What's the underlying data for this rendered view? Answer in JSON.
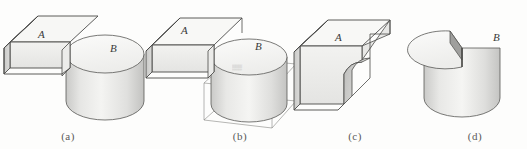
{
  "figure": {
    "background_color": "#fdfdfc",
    "line_color": "#4a4a4a",
    "label_color": "#3a3a3a",
    "caption_color": "#5a5a5a",
    "fill_light": "#f4f4f2",
    "fill_mid": "#e2e2e0",
    "fill_dark": "#c8c8c6",
    "solids": {
      "box_label": "A",
      "cylinder_label": "B"
    },
    "panels": [
      {
        "id": "a",
        "caption": "(a)",
        "caption_x": 68,
        "operation": "two separate solids A and B shown intersecting in place",
        "labels": [
          {
            "text": "A",
            "x": 38,
            "y": 38
          },
          {
            "text": "B",
            "x": 110,
            "y": 52
          }
        ]
      },
      {
        "id": "b",
        "caption": "(b)",
        "caption_x": 240,
        "operation": "union of A and B with wireframe bounding box",
        "labels": [
          {
            "text": "A",
            "x": 181,
            "y": 34
          },
          {
            "text": "B",
            "x": 255,
            "y": 50
          }
        ],
        "artifact_mark": "scan-smudge"
      },
      {
        "id": "c",
        "caption": "(c)",
        "caption_x": 355,
        "operation": "difference A minus B, box with cylindrical notch",
        "labels": [
          {
            "text": "A",
            "x": 335,
            "y": 41
          }
        ]
      },
      {
        "id": "d",
        "caption": "(d)",
        "caption_x": 475,
        "operation": "difference B minus A, cylinder with wedge removed",
        "labels": [
          {
            "text": "B",
            "x": 493,
            "y": 41
          }
        ]
      }
    ]
  }
}
